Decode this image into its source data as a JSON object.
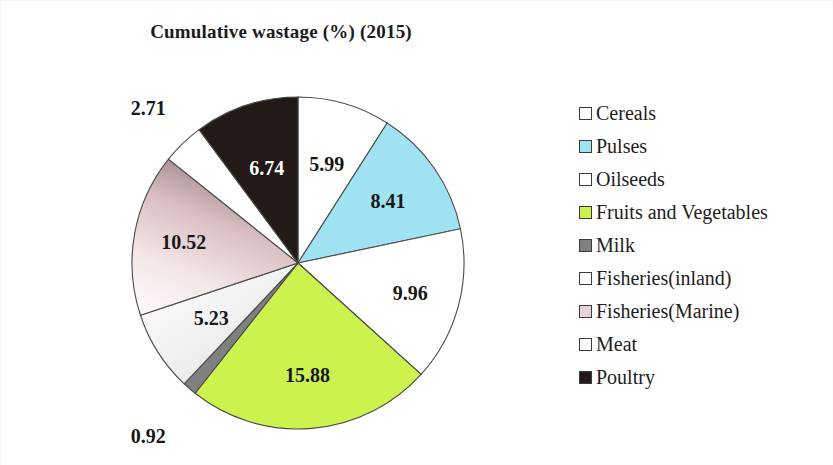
{
  "chart_data": {
    "type": "pie",
    "title": "Cumulative wastage (%) (2015)",
    "xlabel": "",
    "ylabel": "",
    "legend_position": "right",
    "grid": false,
    "start_angle_deg": 0,
    "direction": "clockwise",
    "categories": [
      "Cereals",
      "Pulses",
      "Oilseeds",
      "Fruits and Vegetables",
      "Milk",
      "Fisheries(inland)",
      "Fisheries(Marine)",
      "Meat",
      "Poultry"
    ],
    "values": [
      5.99,
      8.41,
      9.96,
      15.88,
      0.92,
      5.23,
      10.52,
      2.71,
      6.74
    ],
    "data_labels": [
      "5.99",
      "8.41",
      "9.96",
      "15.88",
      "0.92",
      "5.23",
      "10.52",
      "2.71",
      "6.74"
    ],
    "colors": [
      "#ffffff",
      "#9fe2f2",
      "#ffffff",
      "#ccf24d",
      "#808080",
      "#f0f0f0",
      "#e8d3d5",
      "#ffffff",
      "#231a18"
    ],
    "slice_border_color": "#4a4a4a"
  },
  "chart": {
    "title": "Cumulative wastage (%) (2015)"
  },
  "slices": [
    {
      "label": "Cereals",
      "value": "5.99",
      "fill": "#ffffff",
      "text_on_dark": false
    },
    {
      "label": "Pulses",
      "value": "8.41",
      "fill": "#9fe2f2",
      "text_on_dark": false
    },
    {
      "label": "Oilseeds",
      "value": "9.96",
      "fill": "#ffffff",
      "text_on_dark": false
    },
    {
      "label": "Fruits and Vegetables",
      "value": "15.88",
      "fill": "#ccf24d",
      "text_on_dark": false
    },
    {
      "label": "Milk",
      "value": "0.92",
      "fill": "#808080",
      "text_on_dark": false
    },
    {
      "label": "Fisheries(inland)",
      "value": "5.23",
      "fill": "#f0f0f0",
      "text_on_dark": false
    },
    {
      "label": "Fisheries(Marine)",
      "value": "10.52",
      "fill": "#e8d3d5",
      "text_on_dark": false
    },
    {
      "label": "Meat",
      "value": "2.71",
      "fill": "#ffffff",
      "text_on_dark": false
    },
    {
      "label": "Poultry",
      "value": "6.74",
      "fill": "#231a18",
      "text_on_dark": true
    }
  ],
  "legend": {
    "items": [
      {
        "label": "Cereals",
        "swatch": "#ffffff"
      },
      {
        "label": "Pulses",
        "swatch": "#9fe2f2"
      },
      {
        "label": "Oilseeds",
        "swatch": "#ffffff"
      },
      {
        "label": "Fruits and Vegetables",
        "swatch": "#ccf24d"
      },
      {
        "label": "Milk",
        "swatch": "#808080"
      },
      {
        "label": "Fisheries(inland)",
        "swatch": "#ffffff"
      },
      {
        "label": "Fisheries(Marine)",
        "swatch": "#e8d3d5"
      },
      {
        "label": "Meat",
        "swatch": "#ffffff"
      },
      {
        "label": "Poultry",
        "swatch": "#231a18"
      }
    ]
  }
}
